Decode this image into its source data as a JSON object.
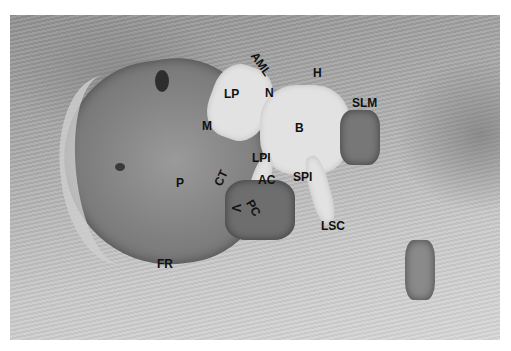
{
  "figure": {
    "labels": [
      {
        "id": "AML",
        "text": "AML",
        "x": 248,
        "y": 58,
        "rotate": 55
      },
      {
        "id": "H",
        "text": "H",
        "x": 313,
        "y": 67,
        "rotate": 0
      },
      {
        "id": "LP",
        "text": "LP",
        "x": 224,
        "y": 88,
        "rotate": 0
      },
      {
        "id": "N",
        "text": "N",
        "x": 265,
        "y": 87,
        "rotate": 0
      },
      {
        "id": "SLM",
        "text": "SLM",
        "x": 352,
        "y": 97,
        "rotate": 0
      },
      {
        "id": "M",
        "text": "M",
        "x": 202,
        "y": 120,
        "rotate": 0
      },
      {
        "id": "B",
        "text": "B",
        "x": 295,
        "y": 122,
        "rotate": 0
      },
      {
        "id": "LPI",
        "text": "LPI",
        "x": 252,
        "y": 152,
        "rotate": 0
      },
      {
        "id": "AC",
        "text": "AC",
        "x": 258,
        "y": 174,
        "rotate": 0
      },
      {
        "id": "SPI",
        "text": "SPI",
        "x": 293,
        "y": 171,
        "rotate": 0
      },
      {
        "id": "CT",
        "text": "CT",
        "x": 213,
        "y": 172,
        "rotate": -65
      },
      {
        "id": "P",
        "text": "P",
        "x": 176,
        "y": 177,
        "rotate": 0
      },
      {
        "id": "PC",
        "text": "PC",
        "x": 245,
        "y": 202,
        "rotate": 60
      },
      {
        "id": "V",
        "text": "V",
        "x": 232,
        "y": 202,
        "rotate": 90
      },
      {
        "id": "LSC",
        "text": "LSC",
        "x": 321,
        "y": 220,
        "rotate": 0
      },
      {
        "id": "FR",
        "text": "FR",
        "x": 157,
        "y": 258,
        "rotate": 0
      }
    ]
  },
  "colors": {
    "border": "#ffffff",
    "label": "#111111"
  }
}
